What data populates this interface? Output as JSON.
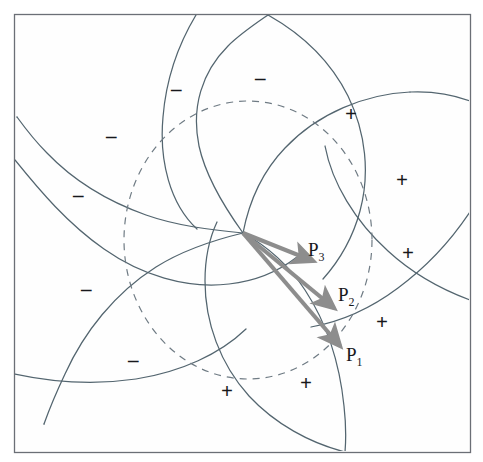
{
  "figure": {
    "type": "geometric-diagram",
    "title": "",
    "canvas": {
      "width": 483,
      "height": 462,
      "background": "#ffffff"
    },
    "frame": {
      "name": "plot-border",
      "x": 14,
      "y": 14,
      "width": 456,
      "height": 438,
      "stroke": "#6b6f76",
      "stroke_width": 1.2,
      "fill": "#ffffff"
    },
    "colors": {
      "curve": "#53656f",
      "dashed_circle": "#6f7b84",
      "arrow": "#8d8d8d",
      "label_text": "#17181c",
      "frame": "#6b6f76"
    },
    "singular_point": {
      "x": 243,
      "y": 233,
      "label": ""
    },
    "dashed_circle": {
      "name": "unit-circle",
      "cx": 248,
      "cy": 240,
      "rx": 124,
      "ry": 139,
      "dash": "7 6",
      "stroke_width": 1.2
    },
    "spiral_arms": {
      "count": 5,
      "description": "five logarithmic-spiral-like arcs emanating from the singular point"
    },
    "arrows": [
      {
        "name": "arrow-p3",
        "label": "P",
        "subscript": "3",
        "from": [
          243,
          233
        ],
        "to": [
          313,
          261
        ],
        "label_x": 308,
        "label_y": 240
      },
      {
        "name": "arrow-p2",
        "label": "P",
        "subscript": "2",
        "from": [
          243,
          233
        ],
        "to": [
          334,
          308
        ],
        "label_x": 338,
        "label_y": 285
      },
      {
        "name": "arrow-p1",
        "label": "P",
        "subscript": "1",
        "from": [
          243,
          233
        ],
        "to": [
          340,
          346
        ],
        "label_x": 346,
        "label_y": 345
      }
    ],
    "plus_signs": [
      {
        "name": "plus-sign-1",
        "text": "+",
        "x": 345,
        "y": 104
      },
      {
        "name": "plus-sign-2",
        "text": "+",
        "x": 396,
        "y": 170
      },
      {
        "name": "plus-sign-3",
        "text": "+",
        "x": 402,
        "y": 243
      },
      {
        "name": "plus-sign-4",
        "text": "+",
        "x": 376,
        "y": 312
      },
      {
        "name": "plus-sign-5",
        "text": "+",
        "x": 300,
        "y": 373
      },
      {
        "name": "plus-sign-6",
        "text": "+",
        "x": 221,
        "y": 381
      }
    ],
    "minus_signs": [
      {
        "name": "minus-sign-1",
        "text": "–",
        "x": 255,
        "y": 68
      },
      {
        "name": "minus-sign-2",
        "text": "–",
        "x": 171,
        "y": 79
      },
      {
        "name": "minus-sign-3",
        "text": "–",
        "x": 106,
        "y": 126
      },
      {
        "name": "minus-sign-4",
        "text": "–",
        "x": 73,
        "y": 185
      },
      {
        "name": "minus-sign-5",
        "text": "–",
        "x": 81,
        "y": 279
      },
      {
        "name": "minus-sign-6",
        "text": "–",
        "x": 128,
        "y": 350
      }
    ]
  }
}
